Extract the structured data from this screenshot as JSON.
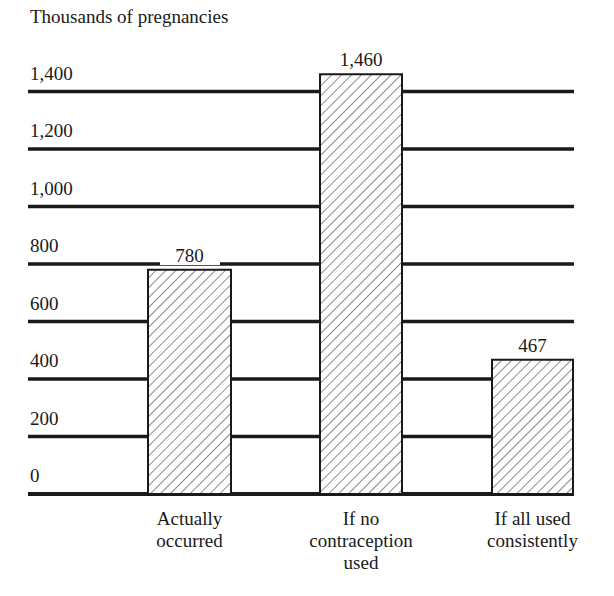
{
  "chart_data": {
    "type": "bar",
    "title": "",
    "ylabel": "Thousands of pregnancies",
    "xlabel": "",
    "categories": [
      "Actually occurred",
      "If no contraception used",
      "If all used consistently"
    ],
    "category_lines": [
      [
        "Actually",
        "occurred"
      ],
      [
        "If no",
        "contraception",
        "used"
      ],
      [
        "If all used",
        "consistently"
      ]
    ],
    "values": [
      780,
      1460,
      467
    ],
    "value_labels": [
      "780",
      "1,460",
      "467"
    ],
    "yticks": [
      0,
      200,
      400,
      600,
      800,
      1000,
      1200,
      1400
    ],
    "ytick_labels": [
      "0",
      "200",
      "400",
      "600",
      "800",
      "1,000",
      "1,200",
      "1,400"
    ],
    "ylim": [
      0,
      1500
    ],
    "grid": true,
    "legend": null,
    "bar_fill": "diagonal-hatch",
    "colors": {
      "ink": "#1a1a1a",
      "background": "#ffffff"
    }
  }
}
